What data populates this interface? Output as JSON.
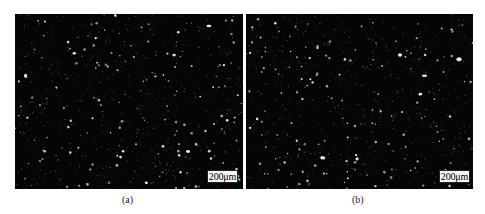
{
  "figure": {
    "panels": [
      {
        "id": "a",
        "caption": "(a)",
        "scale_bar": "200μm",
        "background": "#050505",
        "speck_color": "#e8e8e8"
      },
      {
        "id": "b",
        "caption": "(b)",
        "scale_bar": "200μm",
        "background": "#050505",
        "speck_color": "#e8e8e8"
      }
    ]
  }
}
